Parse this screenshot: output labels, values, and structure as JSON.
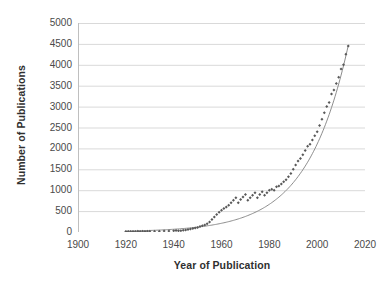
{
  "chart_data": {
    "type": "scatter",
    "title": "",
    "xlabel": "Year of Publication",
    "ylabel": "Number of Publications",
    "xlim": [
      1900,
      2020
    ],
    "ylim": [
      0,
      5000
    ],
    "xticks": [
      1900,
      1920,
      1940,
      1960,
      1980,
      2000,
      2020
    ],
    "yticks": [
      0,
      500,
      1000,
      1500,
      2000,
      2500,
      3000,
      3500,
      4000,
      4500,
      5000
    ],
    "grid": "horizontal",
    "legend": "none",
    "marker_color": "#595959",
    "trendline_color": "#808080",
    "gridline_color": "#d9d9d9",
    "series": [
      {
        "name": "Publications per year",
        "marker": "diamond",
        "x": [
          1920,
          1921,
          1922,
          1923,
          1924,
          1925,
          1926,
          1927,
          1928,
          1929,
          1930,
          1932,
          1934,
          1936,
          1938,
          1940,
          1941,
          1942,
          1943,
          1944,
          1945,
          1946,
          1947,
          1948,
          1949,
          1950,
          1951,
          1952,
          1953,
          1954,
          1955,
          1956,
          1957,
          1958,
          1959,
          1960,
          1961,
          1962,
          1963,
          1964,
          1965,
          1966,
          1967,
          1968,
          1969,
          1970,
          1971,
          1972,
          1973,
          1974,
          1975,
          1976,
          1977,
          1978,
          1979,
          1980,
          1981,
          1982,
          1983,
          1984,
          1985,
          1986,
          1987,
          1988,
          1989,
          1990,
          1991,
          1992,
          1993,
          1994,
          1995,
          1996,
          1997,
          1998,
          1999,
          2000,
          2001,
          2002,
          2003,
          2004,
          2005,
          2006,
          2007,
          2008,
          2009,
          2010,
          2011,
          2012,
          2013
        ],
        "y": [
          10,
          12,
          10,
          14,
          12,
          15,
          13,
          16,
          14,
          18,
          15,
          20,
          18,
          25,
          22,
          30,
          35,
          28,
          32,
          40,
          45,
          60,
          70,
          85,
          95,
          110,
          130,
          150,
          170,
          200,
          240,
          300,
          360,
          420,
          470,
          520,
          560,
          600,
          640,
          700,
          760,
          820,
          700,
          780,
          840,
          900,
          760,
          820,
          880,
          940,
          820,
          900,
          960,
          880,
          940,
          1000,
          1020,
          1000,
          1080,
          1100,
          1150,
          1200,
          1250,
          1320,
          1400,
          1500,
          1600,
          1700,
          1760,
          1850,
          1950,
          2050,
          2100,
          2200,
          2300,
          2400,
          2550,
          2700,
          2850,
          3000,
          3100,
          3300,
          3400,
          3550,
          3700,
          3900,
          4000,
          4250,
          4450
        ]
      }
    ],
    "trendline": {
      "type": "exponential",
      "equation_form": "y = a*exp(b*(year-1900))",
      "a": 6.5,
      "b": 0.0578,
      "x_start": 1920,
      "x_end": 2013
    }
  },
  "axes": {
    "y_tick_labels": [
      "5000",
      "4500",
      "4000",
      "3500",
      "3000",
      "2500",
      "2000",
      "1500",
      "1000",
      "500",
      "0"
    ],
    "x_tick_labels": [
      "1900",
      "1920",
      "1940",
      "1960",
      "1980",
      "2000",
      "2020"
    ]
  },
  "titles": {
    "y_axis": "Number of Publications",
    "x_axis": "Year of Publication"
  }
}
